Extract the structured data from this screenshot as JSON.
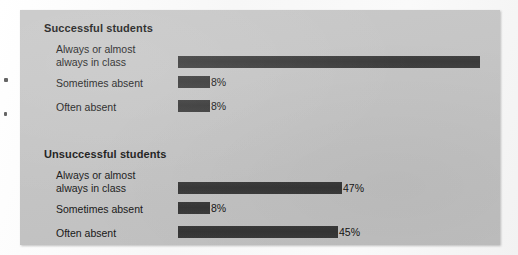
{
  "chart_data": {
    "type": "bar",
    "orientation": "horizontal",
    "title": "",
    "xlabel": "",
    "ylabel": "",
    "value_suffix": "%",
    "bar_color": "#3a3a3a",
    "panel_color": "#c6c6c6",
    "grid": false,
    "legend": false,
    "xlim": [
      0,
      100
    ],
    "categories": [
      "Always or almost always in class",
      "Sometimes absent",
      "Often absent"
    ],
    "series": [
      {
        "name": "Successful students",
        "values": [
          84,
          8,
          8
        ]
      },
      {
        "name": "Unsuccessful students",
        "values": [
          47,
          8,
          45
        ]
      }
    ]
  },
  "panel": {
    "sections": [
      {
        "title": "Successful students",
        "rows": [
          {
            "label_line1": "Always or almost",
            "label_line2": "always in class",
            "value": "84%",
            "bar_px": 302
          },
          {
            "label_line1": "Sometimes absent",
            "label_line2": "",
            "value": "8%",
            "bar_px": 32
          },
          {
            "label_line1": "Often absent",
            "label_line2": "",
            "value": "8%",
            "bar_px": 32
          }
        ]
      },
      {
        "title": "Unsuccessful students",
        "rows": [
          {
            "label_line1": "Always or almost",
            "label_line2": "always in class",
            "value": "47%",
            "bar_px": 164
          },
          {
            "label_line1": "Sometimes absent",
            "label_line2": "",
            "value": "8%",
            "bar_px": 32
          },
          {
            "label_line1": "Often absent",
            "label_line2": "",
            "value": "45%",
            "bar_px": 160
          }
        ]
      }
    ]
  }
}
